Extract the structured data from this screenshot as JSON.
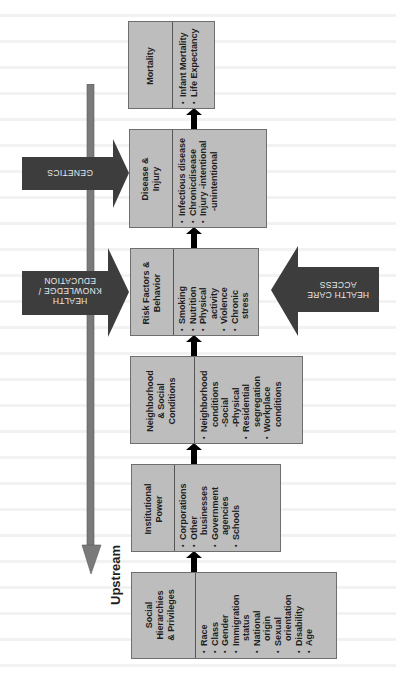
{
  "diagram": {
    "orientation": "rotated-90-ccw",
    "colors": {
      "box_fill": "#bdbdbd",
      "box_border": "#6e6e6e",
      "side_arrow_fill": "#3d3d3d",
      "side_arrow_text": "#e8e8e8",
      "connector_fill": "#000000",
      "gradient_bar": "#7a7a7a"
    },
    "flow_axis_label": "Upstream",
    "boxes": [
      {
        "title": "Social\nHierarchies\n& Privileges",
        "items": [
          "Race",
          "Class",
          "Gender",
          "Immigration\n  status",
          "National\n  origin",
          "Sexual\n  orientation",
          "Disability",
          "Age"
        ]
      },
      {
        "title": "Institutional\nPower",
        "items": [
          "Corporations",
          "Other\n  businesses",
          "Government\n  agencies",
          "Schools"
        ]
      },
      {
        "title": "Neighborhood\n& Social\nConditions",
        "items": [
          "Neighborhood\n  conditions\n  -Social\n  -Physical",
          "Residential\n  segregation",
          "Workplace\n  conditions"
        ]
      },
      {
        "title": "Risk Factors &\nBehavior",
        "items": [
          "Smoking",
          "Nutrition",
          "Physical\n  activity",
          "Violence",
          "Chronic\n  stress"
        ]
      },
      {
        "title": "Disease &\nInjury",
        "items": [
          "Infectious disease",
          "Chronicdisease",
          "Injury -intentional\n  -unintentional"
        ]
      },
      {
        "title": "Mortality",
        "items": [
          "Infant Mortality",
          "Life Expectancy"
        ]
      }
    ],
    "side_arrows": [
      {
        "label": "GENETICS",
        "direction": "toward-disease-injury"
      },
      {
        "label": "HEALTH\nKNOWLEDGE /\nEDUCATION",
        "direction": "toward-risk-factors"
      },
      {
        "label": "HEALTH CARE\nACCESS",
        "direction": "toward-risk-factors"
      }
    ]
  }
}
